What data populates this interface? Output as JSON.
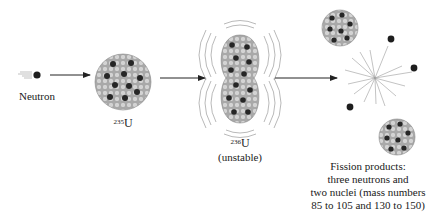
{
  "figure": {
    "neutron": {
      "label": "Neutron"
    },
    "u235": {
      "mass_number": "235",
      "symbol": "U"
    },
    "u236": {
      "mass_number": "236",
      "symbol": "U",
      "note": "(unstable)"
    },
    "products": {
      "lines": [
        "Fission products:",
        "three neutrons and",
        "two nuclei (mass numbers",
        "85 to 105 and 130 to 150)"
      ]
    }
  },
  "colors": {
    "nucleon_light": "#c8c8c8",
    "nucleon_dark": "#2a2a2a",
    "arrow": "#222222",
    "wave": "#888888"
  }
}
